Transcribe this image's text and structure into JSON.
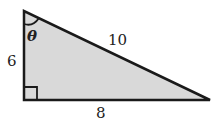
{
  "diagram": {
    "type": "right-triangle",
    "fill_color": "#d9d9d9",
    "stroke_color": "#1a1a1a",
    "labels": {
      "vertical_leg": "6",
      "hypotenuse": "10",
      "horizontal_leg": "8",
      "angle": "θ"
    },
    "right_angle_marker": "bottom-left"
  }
}
